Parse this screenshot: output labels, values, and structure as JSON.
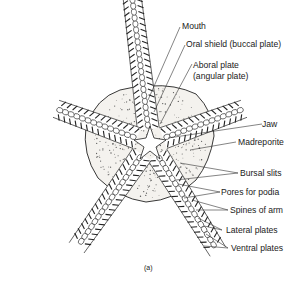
{
  "figure": {
    "caption": "(a)",
    "labels": [
      {
        "id": "mouth",
        "text": "Mouth"
      },
      {
        "id": "oral-shield",
        "text": "Oral shield (buccal plate)"
      },
      {
        "id": "aboral-plate-1",
        "text": "Aboral plate"
      },
      {
        "id": "aboral-plate-2",
        "text": "(angular plate)"
      },
      {
        "id": "jaw",
        "text": "Jaw"
      },
      {
        "id": "madreporite",
        "text": "Madreporite"
      },
      {
        "id": "bursal-slits",
        "text": "Bursal slits"
      },
      {
        "id": "pores-for-podia",
        "text": "Pores for podia"
      },
      {
        "id": "spines-of-arm",
        "text": "Spines of arm"
      },
      {
        "id": "lateral-plates",
        "text": "Lateral plates"
      },
      {
        "id": "ventral-plates",
        "text": "Ventral plates"
      }
    ]
  }
}
